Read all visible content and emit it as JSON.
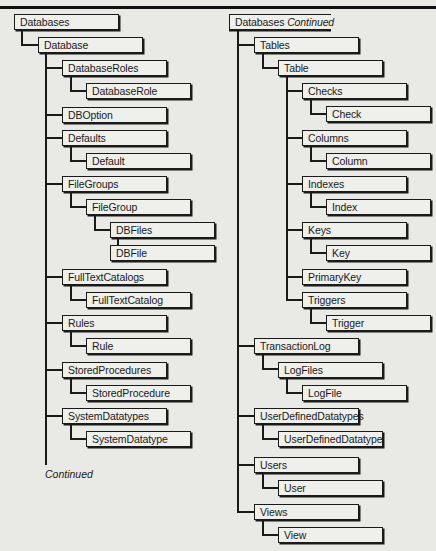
{
  "left_tree": {
    "root": "Databases",
    "nodes": [
      {
        "label": "Database"
      },
      {
        "label": "DatabaseRoles"
      },
      {
        "label": "DatabaseRole"
      },
      {
        "label": "DBOption"
      },
      {
        "label": "Defaults"
      },
      {
        "label": "Default"
      },
      {
        "label": "FileGroups"
      },
      {
        "label": "FileGroup"
      },
      {
        "label": "DBFiles"
      },
      {
        "label": "DBFile"
      },
      {
        "label": "FullTextCatalogs"
      },
      {
        "label": "FullTextCatalog"
      },
      {
        "label": "Rules"
      },
      {
        "label": "Rule"
      },
      {
        "label": "StoredProcedures"
      },
      {
        "label": "StoredProcedure"
      },
      {
        "label": "SystemDatatypes"
      },
      {
        "label": "SystemDatatype"
      }
    ],
    "continued_label": "Continued"
  },
  "right_tree": {
    "root": "Databases",
    "root_suffix": "Continued",
    "nodes": [
      {
        "label": "Tables"
      },
      {
        "label": "Table"
      },
      {
        "label": "Checks"
      },
      {
        "label": "Check"
      },
      {
        "label": "Columns"
      },
      {
        "label": "Column"
      },
      {
        "label": "Indexes"
      },
      {
        "label": "Index"
      },
      {
        "label": "Keys"
      },
      {
        "label": "Key"
      },
      {
        "label": "PrimaryKey"
      },
      {
        "label": "Triggers"
      },
      {
        "label": "Trigger"
      },
      {
        "label": "TransactionLog"
      },
      {
        "label": "LogFiles"
      },
      {
        "label": "LogFile"
      },
      {
        "label": "UserDefinedDatatypes"
      },
      {
        "label": "UserDefinedDatatype"
      },
      {
        "label": "Users"
      },
      {
        "label": "User"
      },
      {
        "label": "Views"
      },
      {
        "label": "View"
      }
    ]
  }
}
